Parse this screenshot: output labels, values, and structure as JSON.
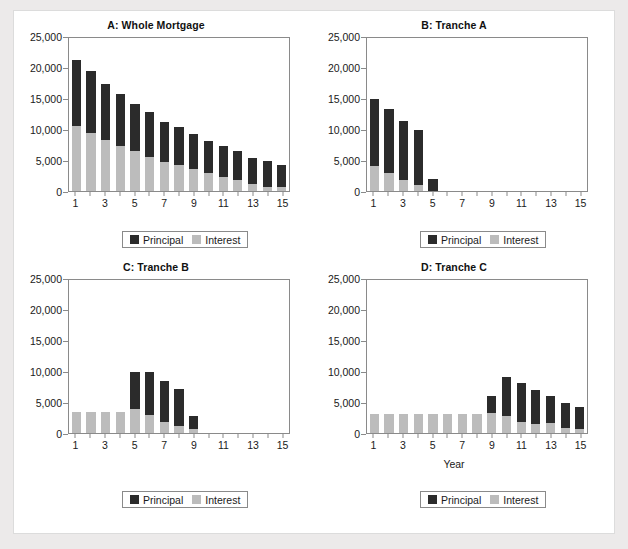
{
  "figure": {
    "background_color": "#eceaea",
    "card_color": "#ffffff",
    "principal_color": "#2b2b2b",
    "interest_color": "#bcbcbc"
  },
  "legend": {
    "principal_label": "Principal",
    "interest_label": "Interest"
  },
  "chart_data": [
    {
      "type": "bar",
      "title": "A: Whole Mortgage",
      "xlabel": "",
      "ylabel": "",
      "ylim": [
        0,
        25000
      ],
      "yticks": [
        0,
        5000,
        10000,
        15000,
        20000,
        25000
      ],
      "ytick_labels": [
        "0",
        "5,000",
        "10,000",
        "15,000",
        "20,000",
        "25,000"
      ],
      "xlim": [
        1,
        15
      ],
      "categories": [
        1,
        2,
        3,
        4,
        5,
        6,
        7,
        8,
        9,
        10,
        11,
        12,
        13,
        14,
        15
      ],
      "xtick_labels": [
        "1",
        "3",
        "5",
        "7",
        "9",
        "11",
        "13",
        "15"
      ],
      "xticks": [
        1,
        3,
        5,
        7,
        9,
        11,
        13,
        15
      ],
      "stacked": true,
      "grid": false,
      "legend_position": "below",
      "series": [
        {
          "name": "Interest",
          "values": [
            10500,
            9300,
            8200,
            7200,
            6400,
            5500,
            4700,
            4200,
            3500,
            2900,
            2200,
            1750,
            1200,
            650,
            600
          ]
        },
        {
          "name": "Principal",
          "values": [
            10600,
            10000,
            9100,
            8400,
            7600,
            7200,
            6500,
            6100,
            5700,
            5200,
            5000,
            4650,
            4200,
            4200,
            3550
          ]
        }
      ],
      "totals": [
        21100,
        19300,
        17300,
        15600,
        14000,
        12700,
        11200,
        10300,
        9200,
        8100,
        7200,
        6400,
        5400,
        4850,
        4150
      ]
    },
    {
      "type": "bar",
      "title": "B: Tranche A",
      "xlabel": "",
      "ylabel": "",
      "ylim": [
        0,
        25000
      ],
      "yticks": [
        0,
        5000,
        10000,
        15000,
        20000,
        25000
      ],
      "ytick_labels": [
        "0",
        "5,000",
        "10,000",
        "15,000",
        "20,000",
        "25,000"
      ],
      "xlim": [
        1,
        15
      ],
      "categories": [
        1,
        2,
        3,
        4,
        5,
        6,
        7,
        8,
        9,
        10,
        11,
        12,
        13,
        14,
        15
      ],
      "xtick_labels": [
        "1",
        "3",
        "5",
        "7",
        "9",
        "11",
        "13",
        "15"
      ],
      "xticks": [
        1,
        3,
        5,
        7,
        9,
        11,
        13,
        15
      ],
      "stacked": true,
      "grid": false,
      "legend_position": "below",
      "series": [
        {
          "name": "Interest",
          "values": [
            4000,
            2850,
            1850,
            1000,
            0,
            0,
            0,
            0,
            0,
            0,
            0,
            0,
            0,
            0,
            0
          ]
        },
        {
          "name": "Principal",
          "values": [
            10900,
            10300,
            9450,
            8800,
            1900,
            0,
            0,
            0,
            0,
            0,
            0,
            0,
            0,
            0,
            0
          ]
        }
      ],
      "totals": [
        14900,
        13150,
        11300,
        9800,
        1900,
        0,
        0,
        0,
        0,
        0,
        0,
        0,
        0,
        0,
        0
      ]
    },
    {
      "type": "bar",
      "title": "C: Tranche B",
      "xlabel": "",
      "ylabel": "",
      "ylim": [
        0,
        25000
      ],
      "yticks": [
        0,
        5000,
        10000,
        15000,
        20000,
        25000
      ],
      "ytick_labels": [
        "0",
        "5,000",
        "10,000",
        "15,000",
        "20,000",
        "25,000"
      ],
      "xlim": [
        1,
        15
      ],
      "categories": [
        1,
        2,
        3,
        4,
        5,
        6,
        7,
        8,
        9,
        10,
        11,
        12,
        13,
        14,
        15
      ],
      "xtick_labels": [
        "1",
        "3",
        "5",
        "7",
        "9",
        "11",
        "13",
        "15"
      ],
      "xticks": [
        1,
        3,
        5,
        7,
        9,
        11,
        13,
        15
      ],
      "stacked": true,
      "grid": false,
      "legend_position": "below",
      "series": [
        {
          "name": "Interest",
          "values": [
            3400,
            3400,
            3400,
            3400,
            3800,
            2900,
            1850,
            1200,
            700,
            0,
            0,
            0,
            0,
            0,
            0
          ]
        },
        {
          "name": "Principal",
          "values": [
            0,
            0,
            0,
            0,
            6000,
            7000,
            6550,
            5900,
            2000,
            0,
            0,
            0,
            0,
            0,
            0
          ]
        }
      ],
      "totals": [
        3400,
        3400,
        3400,
        3400,
        9800,
        9900,
        8400,
        7100,
        2700,
        0,
        0,
        0,
        0,
        0,
        0
      ]
    },
    {
      "type": "bar",
      "title": "D: Tranche C",
      "xlabel": "Year",
      "ylabel": "",
      "ylim": [
        0,
        25000
      ],
      "yticks": [
        0,
        5000,
        10000,
        15000,
        20000,
        25000
      ],
      "ytick_labels": [
        "0",
        "5,000",
        "10,000",
        "15,000",
        "20,000",
        "25,000"
      ],
      "xlim": [
        1,
        15
      ],
      "categories": [
        1,
        2,
        3,
        4,
        5,
        6,
        7,
        8,
        9,
        10,
        11,
        12,
        13,
        14,
        15
      ],
      "xtick_labels": [
        "1",
        "3",
        "5",
        "7",
        "9",
        "11",
        "13",
        "15"
      ],
      "xticks": [
        1,
        3,
        5,
        7,
        9,
        11,
        13,
        15
      ],
      "stacked": true,
      "grid": false,
      "legend_position": "below",
      "series": [
        {
          "name": "Interest",
          "values": [
            3000,
            3000,
            3000,
            3000,
            3000,
            3000,
            3000,
            3000,
            3150,
            2800,
            1800,
            1400,
            1600,
            800,
            650
          ]
        },
        {
          "name": "Principal",
          "values": [
            0,
            0,
            0,
            0,
            0,
            0,
            0,
            0,
            2850,
            6200,
            6200,
            5500,
            4400,
            4050,
            3500
          ]
        }
      ],
      "totals": [
        3000,
        3000,
        3000,
        3000,
        3000,
        3000,
        3000,
        3000,
        6000,
        9000,
        8000,
        6900,
        6000,
        4850,
        4150
      ]
    }
  ]
}
